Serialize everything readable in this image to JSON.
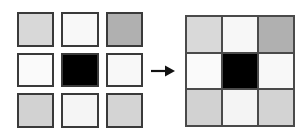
{
  "figure": {
    "background_color": "#ffffff",
    "arrow": {
      "icon": "arrow-right-icon",
      "label": "transforms into",
      "color": "#111111",
      "direction": "right"
    }
  },
  "separated_grid": {
    "name": "separated tile grid",
    "rows": 3,
    "columns": 3,
    "border_color": "#3a3a3a",
    "border_width_px": 2,
    "gap_px": 7,
    "cells": [
      {
        "row": 1,
        "col": 1,
        "shade": "light-gray",
        "color": "#d8d8d8"
      },
      {
        "row": 1,
        "col": 2,
        "shade": "near-white",
        "color": "#f8f8f8"
      },
      {
        "row": 1,
        "col": 3,
        "shade": "medium-gray",
        "color": "#b0b0b0"
      },
      {
        "row": 2,
        "col": 1,
        "shade": "near-white",
        "color": "#fafafa"
      },
      {
        "row": 2,
        "col": 2,
        "shade": "black",
        "color": "#000000"
      },
      {
        "row": 2,
        "col": 3,
        "shade": "near-white",
        "color": "#f8f8f8"
      },
      {
        "row": 3,
        "col": 1,
        "shade": "light-gray",
        "color": "#d2d2d2"
      },
      {
        "row": 3,
        "col": 2,
        "shade": "near-white",
        "color": "#f5f5f5"
      },
      {
        "row": 3,
        "col": 3,
        "shade": "light-gray",
        "color": "#d4d4d4"
      }
    ]
  },
  "merged_grid": {
    "name": "contiguous tile grid",
    "rows": 3,
    "columns": 3,
    "border_color": "#4a4a4a",
    "border_width_px": 2,
    "gridline_width_px": 2,
    "cells": [
      {
        "row": 1,
        "col": 1,
        "shade": "light-gray",
        "color": "#d9d9d9"
      },
      {
        "row": 1,
        "col": 2,
        "shade": "near-white",
        "color": "#f7f7f7"
      },
      {
        "row": 1,
        "col": 3,
        "shade": "medium-gray",
        "color": "#b0b0b0"
      },
      {
        "row": 2,
        "col": 1,
        "shade": "near-white",
        "color": "#fafafa"
      },
      {
        "row": 2,
        "col": 2,
        "shade": "black",
        "color": "#000000"
      },
      {
        "row": 2,
        "col": 3,
        "shade": "near-white",
        "color": "#f8f8f8"
      },
      {
        "row": 3,
        "col": 1,
        "shade": "light-gray",
        "color": "#d2d2d2"
      },
      {
        "row": 3,
        "col": 2,
        "shade": "near-white",
        "color": "#f4f4f4"
      },
      {
        "row": 3,
        "col": 3,
        "shade": "light-gray",
        "color": "#d3d3d3"
      }
    ]
  }
}
